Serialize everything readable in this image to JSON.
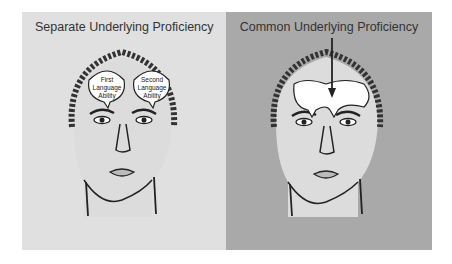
{
  "left_panel": {
    "title": "Separate Underlying Proficiency",
    "bubble_1": [
      "First",
      "Language",
      "Ability"
    ],
    "bubble_2": [
      "Second",
      "Language",
      "Ability"
    ],
    "background": "#e0e0e0"
  },
  "right_panel": {
    "title": "Common Underlying Proficiency",
    "background": "#a9a9a9"
  }
}
